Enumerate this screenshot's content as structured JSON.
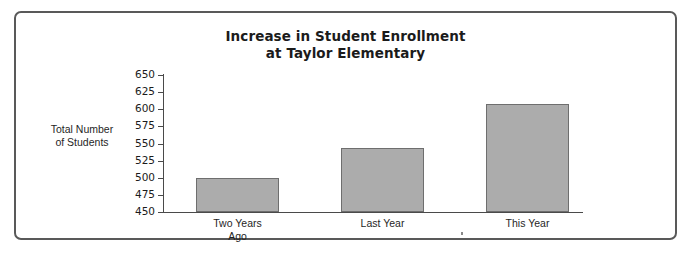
{
  "chart_data": {
    "type": "bar",
    "title": "Increase in Student Enrollment at Taylor Elementary",
    "title_lines": [
      "Increase in Student Enrollment",
      "at Taylor Elementary"
    ],
    "categories": [
      "Two Years Ago",
      "Last Year",
      "This Year"
    ],
    "category_lines": [
      [
        "Two Years",
        "Ago"
      ],
      [
        "Last Year"
      ],
      [
        "This Year"
      ]
    ],
    "values": [
      500,
      544,
      608
    ],
    "xlabel": "",
    "ylabel": "Total Number of Students",
    "ylabel_lines": [
      "Total Number",
      "of Students"
    ],
    "ylim": [
      450,
      650
    ],
    "ytick_step": 25,
    "yticks": [
      650,
      625,
      600,
      575,
      550,
      525,
      500,
      475,
      450
    ],
    "grid": false,
    "legend": false,
    "bar_color": "#acacac",
    "bar_border_color": "#6e6e6e",
    "axis_color": "#4a4a4a",
    "frame_color": "#595959",
    "background_color": "#ffffff"
  }
}
